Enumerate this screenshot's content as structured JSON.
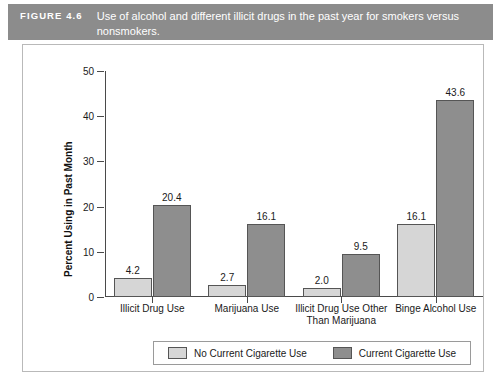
{
  "banner": {
    "tag": "FIGURE 4.6",
    "caption": "Use of alcohol and different illicit drugs in the past year for smokers versus nonsmokers."
  },
  "chart_data": {
    "type": "bar",
    "title": "Use of alcohol and different illicit drugs in the past year for smokers versus nonsmokers.",
    "xlabel": "",
    "ylabel": "Percent Using in Past Month",
    "ylim": [
      0,
      50
    ],
    "yticks": [
      0,
      10,
      20,
      30,
      40,
      50
    ],
    "grid": false,
    "legend_position": "bottom",
    "categories": [
      "Illicit Drug Use",
      "Marijuana Use",
      "Illicit Drug Use Other Than Marijuana",
      "Binge Alcohol Use"
    ],
    "series": [
      {
        "name": "No Current Cigarette Use",
        "color": "#d6d6d6",
        "values": [
          4.2,
          2.7,
          2.0,
          16.1
        ]
      },
      {
        "name": "Current Cigarette Use",
        "color": "#8e8e8e",
        "values": [
          20.4,
          16.1,
          9.5,
          43.6
        ]
      }
    ],
    "value_labels": [
      [
        "4.2",
        "20.4"
      ],
      [
        "2.7",
        "16.1"
      ],
      [
        "2.0",
        "9.5"
      ],
      [
        "16.1",
        "43.6"
      ]
    ]
  },
  "legend": {
    "items": [
      {
        "label": "No Current Cigarette Use"
      },
      {
        "label": "Current Cigarette Use"
      }
    ]
  },
  "colors": {
    "banner": "#8c8c8c",
    "series_light": "#d6d6d6",
    "series_dark": "#8e8e8e",
    "axis": "#4a4a4a"
  }
}
